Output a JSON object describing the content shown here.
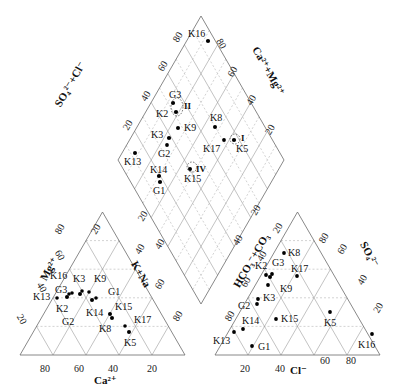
{
  "diagram": {
    "type": "piper",
    "left_triangle": {
      "name": "cations",
      "axes": {
        "bottom": "Ca²⁺",
        "left": "Mg²⁺",
        "right": "K+Na"
      },
      "bottom_ticks": [
        "80",
        "60",
        "40",
        "20"
      ],
      "left_ticks": [
        "20",
        "40",
        "60",
        "80"
      ],
      "right_ticks": [
        "20",
        "40",
        "60",
        "80"
      ],
      "points": [
        {
          "label": "K16"
        },
        {
          "label": "K3"
        },
        {
          "label": "K9"
        },
        {
          "label": "G3"
        },
        {
          "label": "G1"
        },
        {
          "label": "K13"
        },
        {
          "label": "K2"
        },
        {
          "label": "K14"
        },
        {
          "label": "K15"
        },
        {
          "label": "G2"
        },
        {
          "label": "K17"
        },
        {
          "label": "K8"
        },
        {
          "label": "K5"
        }
      ]
    },
    "right_triangle": {
      "name": "anions",
      "axes": {
        "bottom": "Cl⁻",
        "left": "HCO₃⁻+CO₃²⁻",
        "right": "SO₄²⁻"
      },
      "bottom_ticks": [
        "20",
        "40",
        "60",
        "80"
      ],
      "left_ticks": [
        "80",
        "60",
        "40",
        "20"
      ],
      "right_ticks": [
        "60",
        "40",
        "20"
      ],
      "points": [
        {
          "label": "K8"
        },
        {
          "label": "K2"
        },
        {
          "label": "G3"
        },
        {
          "label": "K17"
        },
        {
          "label": "K9"
        },
        {
          "label": "K3"
        },
        {
          "label": "G2"
        },
        {
          "label": "K14"
        },
        {
          "label": "K15"
        },
        {
          "label": "K5"
        },
        {
          "label": "K13"
        },
        {
          "label": "G1"
        },
        {
          "label": "K16"
        }
      ]
    },
    "diamond": {
      "axes": {
        "upper_left": "SO₄²⁻+Cl⁻",
        "upper_right": "Ca²⁺+Mg²⁺"
      },
      "upper_left_ticks": [
        "80",
        "60",
        "40",
        "20"
      ],
      "upper_right_ticks": [
        "80",
        "60",
        "40",
        "20"
      ],
      "lower_left_ticks": [
        "20",
        "40",
        "60",
        "80"
      ],
      "lower_right_ticks": [
        "20",
        "40",
        "60",
        "80"
      ],
      "points": [
        {
          "label": "K16"
        },
        {
          "label": "G3"
        },
        {
          "label": "K2"
        },
        {
          "label": "K9"
        },
        {
          "label": "K8"
        },
        {
          "label": "K3"
        },
        {
          "label": "G2"
        },
        {
          "label": "K17"
        },
        {
          "label": "K5"
        },
        {
          "label": "K13"
        },
        {
          "label": "K14"
        },
        {
          "label": "G1"
        },
        {
          "label": "K15"
        }
      ],
      "groups": [
        {
          "label": "I"
        },
        {
          "label": "II"
        },
        {
          "label": "IV"
        }
      ]
    }
  },
  "labels": {
    "ca": "Ca²⁺",
    "mg": "Mg²⁺",
    "kna": "K+Na",
    "cl": "Cl⁻",
    "hco3": "HCO₃⁻+CO₃",
    "so4": "SO₄²⁻",
    "so4cl": "SO₄²⁻+Cl⁻",
    "camg": "Ca²⁺+Mg²⁺",
    "t20": "20",
    "t40": "40",
    "t60": "60",
    "t80": "80",
    "gI": "I",
    "gII": "II",
    "gIV": "IV",
    "K2": "K2",
    "K3": "K3",
    "K5": "K5",
    "K8": "K8",
    "K9": "K9",
    "K13": "K13",
    "K14": "K14",
    "K15": "K15",
    "K16": "K16",
    "K17": "K17",
    "G1": "G1",
    "G2": "G2",
    "G3": "G3"
  }
}
